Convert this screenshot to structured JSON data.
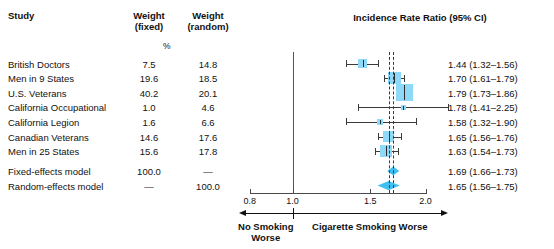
{
  "figure": {
    "type": "forest-plot",
    "columns": {
      "study": "Study",
      "weight_fixed": "Weight\n(fixed)",
      "weight_fixed_l1": "Weight",
      "weight_fixed_l2": "(fixed)",
      "weight_random_l1": "Weight",
      "weight_random_l2": "(random)",
      "percent_symbol": "%",
      "plot_title": "Incidence Rate Ratio (95% CI)"
    },
    "axis": {
      "scale": "log",
      "ticks": [
        0.8,
        1.0,
        1.5,
        2.0
      ],
      "tick_labels": [
        "0.8",
        "1.0",
        "1.5",
        "2.0"
      ],
      "null_value": 1.0,
      "left_arrow_label_l1": "No Smoking",
      "left_arrow_label_l2": "Worse",
      "right_arrow_label": "Cigarette Smoking Worse"
    },
    "reference_lines": [
      1.65,
      1.69
    ],
    "colors": {
      "marker_box": "#8ed8f8",
      "diamond": "#3fc0f0",
      "ci_line": "#3b3b3b",
      "axis": "#4a4a4a",
      "text": "#111111"
    }
  },
  "chart_data": {
    "type": "forest",
    "title": "Incidence Rate Ratio (95% CI)",
    "xlabel": "Incidence Rate Ratio",
    "ylabel": "",
    "xscale": "log",
    "xlim": [
      0.78,
      2.1
    ],
    "xticks": [
      0.8,
      1.0,
      1.5,
      2.0
    ],
    "grid": false,
    "null_line": 1.0,
    "rows": [
      {
        "study": "British Doctors",
        "weight_fixed": "7.5",
        "weight_random": "14.8",
        "estimate": 1.44,
        "ci_low": 1.32,
        "ci_high": 1.56,
        "effect_text": "1.44 (1.32–1.56)",
        "marker": "box"
      },
      {
        "study": "Men in 9 States",
        "weight_fixed": "19.6",
        "weight_random": "18.5",
        "estimate": 1.7,
        "ci_low": 1.61,
        "ci_high": 1.79,
        "effect_text": "1.70 (1.61–1.79)",
        "marker": "box"
      },
      {
        "study": "U.S. Veterans",
        "weight_fixed": "40.2",
        "weight_random": "20.1",
        "estimate": 1.79,
        "ci_low": 1.73,
        "ci_high": 1.86,
        "effect_text": "1.79 (1.73–1.86)",
        "marker": "box"
      },
      {
        "study": "California Occupational",
        "weight_fixed": "1.0",
        "weight_random": "4.6",
        "estimate": 1.78,
        "ci_low": 1.41,
        "ci_high": 2.25,
        "effect_text": "1.78 (1.41–2.25)",
        "marker": "box"
      },
      {
        "study": "California Legion",
        "weight_fixed": "1.6",
        "weight_random": "6.6",
        "estimate": 1.58,
        "ci_low": 1.32,
        "ci_high": 1.9,
        "effect_text": "1.58 (1.32–1.90)",
        "marker": "box"
      },
      {
        "study": "Canadian Veterans",
        "weight_fixed": "14.6",
        "weight_random": "17.6",
        "estimate": 1.65,
        "ci_low": 1.56,
        "ci_high": 1.76,
        "effect_text": "1.65 (1.56–1.76)",
        "marker": "box"
      },
      {
        "study": "Men in 25 States",
        "weight_fixed": "15.6",
        "weight_random": "17.8",
        "estimate": 1.63,
        "ci_low": 1.54,
        "ci_high": 1.73,
        "effect_text": "1.63 (1.54–1.73)",
        "marker": "box"
      }
    ],
    "summaries": [
      {
        "study": "Fixed-effects model",
        "weight_fixed": "100.0",
        "weight_random": "—",
        "estimate": 1.69,
        "ci_low": 1.66,
        "ci_high": 1.73,
        "effect_text": "1.69 (1.66–1.73)",
        "marker": "diamond"
      },
      {
        "study": "Random-effects model",
        "weight_fixed": "—",
        "weight_random": "100.0",
        "estimate": 1.65,
        "ci_low": 1.56,
        "ci_high": 1.75,
        "effect_text": "1.65 (1.56–1.75)",
        "marker": "diamond"
      }
    ]
  }
}
